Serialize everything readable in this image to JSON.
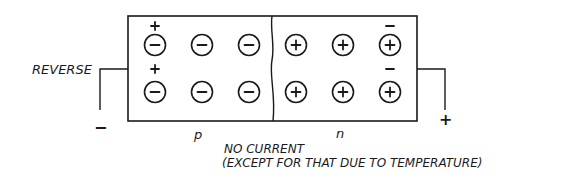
{
  "diagram": {
    "labels": {
      "bias": "REVERSE",
      "p_region": "p",
      "n_region": "n",
      "caption_line1": "NO CURRENT",
      "caption_line2": "(EXCEPT FOR THAT DUE TO TEMPERATURE)",
      "left_terminal": "−",
      "right_terminal": "+"
    },
    "p_region": {
      "ions": [
        {
          "charge": "−",
          "x": 155,
          "y": 45
        },
        {
          "charge": "−",
          "x": 202,
          "y": 45
        },
        {
          "charge": "−",
          "x": 249,
          "y": 45
        },
        {
          "charge": "−",
          "x": 155,
          "y": 92
        },
        {
          "charge": "−",
          "x": 202,
          "y": 92
        },
        {
          "charge": "−",
          "x": 249,
          "y": 92
        }
      ],
      "carriers": [
        {
          "charge": "+",
          "x": 155,
          "y": 26
        },
        {
          "charge": "+",
          "x": 155,
          "y": 69
        }
      ]
    },
    "n_region": {
      "ions": [
        {
          "charge": "+",
          "x": 296,
          "y": 45
        },
        {
          "charge": "+",
          "x": 343,
          "y": 45
        },
        {
          "charge": "+",
          "x": 390,
          "y": 45
        },
        {
          "charge": "+",
          "x": 296,
          "y": 92
        },
        {
          "charge": "+",
          "x": 343,
          "y": 92
        },
        {
          "charge": "+",
          "x": 390,
          "y": 92
        }
      ],
      "carriers": [
        {
          "charge": "−",
          "x": 390,
          "y": 26
        },
        {
          "charge": "−",
          "x": 390,
          "y": 69
        }
      ]
    },
    "colors": {
      "ink": "#1a1a1a",
      "background": "#ffffff"
    }
  }
}
